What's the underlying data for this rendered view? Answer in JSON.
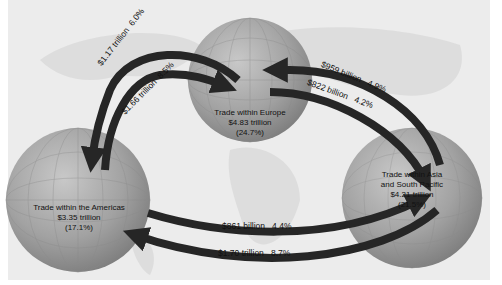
{
  "diagram": {
    "title": "",
    "regions": [
      {
        "id": "americas",
        "line1": "Trade within the Americas",
        "line2": "",
        "value": "$3.35 trillion",
        "share": "(17.1%)"
      },
      {
        "id": "europe",
        "line1": "Trade within Europe",
        "line2": "",
        "value": "$4.83 trillion",
        "share": "(24.7%)"
      },
      {
        "id": "asia",
        "line1": "Trade within Asia",
        "line2": "and South Pacific",
        "value": "$4.21 trillion",
        "share": "(21.5%)"
      }
    ],
    "flows": [
      {
        "from": "europe",
        "to": "americas",
        "amount": "$1.17 trillion",
        "pct": "6.0%"
      },
      {
        "from": "americas",
        "to": "europe",
        "amount": "$1.66 trillion",
        "pct": "8.5%"
      },
      {
        "from": "asia",
        "to": "europe",
        "amount": "$959 billion",
        "pct": "4.9%"
      },
      {
        "from": "europe",
        "to": "asia",
        "amount": "$822 billion",
        "pct": "4.2%"
      },
      {
        "from": "americas",
        "to": "asia",
        "amount": "$861 billion",
        "pct": "4.4%"
      },
      {
        "from": "asia",
        "to": "americas",
        "amount": "$1.70 trillion",
        "pct": "8.7%"
      }
    ],
    "colors": {
      "background": "#ececec",
      "globe": "#9a9a9a",
      "arrow": "#262626",
      "text": "#111111"
    }
  }
}
